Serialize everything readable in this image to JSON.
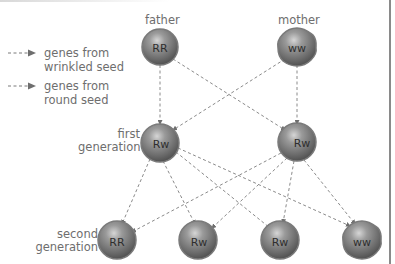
{
  "legend": {
    "items": [
      {
        "label": "genes from\nwrinkled seed",
        "arrow_color": "#7a7a7a"
      },
      {
        "label": "genes from\nround seed",
        "arrow_color": "#7a7a7a"
      }
    ]
  },
  "labels": {
    "father": "father",
    "mother": "mother",
    "first_generation": "first\ngeneration",
    "second_generation": "second\ngeneration"
  },
  "nodes": {
    "father": {
      "genotype": "RR",
      "shape": "round"
    },
    "mother": {
      "genotype": "ww",
      "shape": "wrinkled"
    },
    "first_left": {
      "genotype": "Rw",
      "shape": "round"
    },
    "first_right": {
      "genotype": "Rw",
      "shape": "round"
    },
    "second_1": {
      "genotype": "RR",
      "shape": "round"
    },
    "second_2": {
      "genotype": "Rw",
      "shape": "round"
    },
    "second_3": {
      "genotype": "Rw",
      "shape": "round"
    },
    "second_4": {
      "genotype": "ww",
      "shape": "wrinkled"
    }
  },
  "colors": {
    "pea_dark": "#5a5a5a",
    "pea_mid": "#8e8e8e",
    "pea_light": "#c4c4c4",
    "line": "#8a8a8a"
  }
}
